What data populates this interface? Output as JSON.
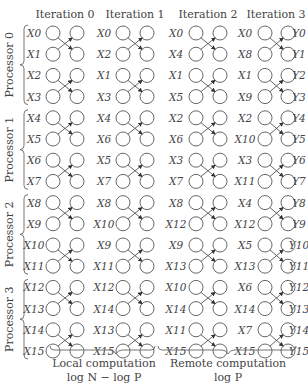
{
  "diagram": {
    "iterations": [
      "Iteration 0",
      "Iteration 1",
      "Iteration 2",
      "Iteration 3"
    ],
    "processors": [
      "Processor 0",
      "Processor 1",
      "Processor 2",
      "Processor 3"
    ],
    "columns": [
      [
        "X0",
        "X1",
        "X2",
        "X3",
        "X4",
        "X5",
        "X6",
        "X7",
        "X8",
        "X9",
        "X10",
        "X11",
        "X12",
        "X13",
        "X14",
        "X15"
      ],
      [
        "X0",
        "X2",
        "X1",
        "X3",
        "X4",
        "X6",
        "X5",
        "X7",
        "X8",
        "X10",
        "X9",
        "X11",
        "X12",
        "X14",
        "X13",
        "X15"
      ],
      [
        "X0",
        "X4",
        "X1",
        "X5",
        "X2",
        "X6",
        "X3",
        "X7",
        "X8",
        "X12",
        "X9",
        "X13",
        "X10",
        "X14",
        "X11",
        "X15"
      ],
      [
        "X0",
        "X8",
        "X1",
        "X9",
        "X2",
        "X10",
        "X3",
        "X11",
        "X4",
        "X12",
        "X5",
        "X13",
        "X6",
        "X14",
        "X7",
        "X15"
      ]
    ],
    "outputs": [
      "Y0",
      "Y1",
      "Y2",
      "Y3",
      "Y4",
      "Y5",
      "Y6",
      "Y7",
      "Y8",
      "Y9",
      "Y10",
      "Y11",
      "Y12",
      "Y13",
      "Y14",
      "Y15"
    ],
    "footer": {
      "local_title": "Local computation",
      "local_formula": "log N − log P",
      "remote_title": "Remote computation",
      "remote_formula": "log P"
    }
  }
}
